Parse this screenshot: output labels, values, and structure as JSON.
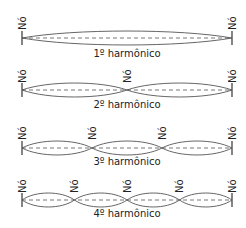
{
  "diagram": {
    "node_label": "Nó",
    "width": 246,
    "height": 228,
    "x_start": 22,
    "x_end": 232,
    "colors": {
      "wave": "#555555",
      "axis": "#555555",
      "text": "#222222",
      "background": "#ffffff"
    },
    "rows": [
      {
        "label": "1º harmônico",
        "n": 1,
        "axis_y": 38,
        "amplitude": 7,
        "label_y": 57,
        "node_label_y": 30
      },
      {
        "label": "2º harmônico",
        "n": 2,
        "axis_y": 90,
        "amplitude": 7,
        "label_y": 108,
        "node_label_y": 83
      },
      {
        "label": "3º harmônico",
        "n": 3,
        "axis_y": 148,
        "amplitude": 7,
        "label_y": 165,
        "node_label_y": 140
      },
      {
        "label": "4º harmônico",
        "n": 4,
        "axis_y": 200,
        "amplitude": 7,
        "label_y": 217,
        "node_label_y": 193
      }
    ]
  }
}
